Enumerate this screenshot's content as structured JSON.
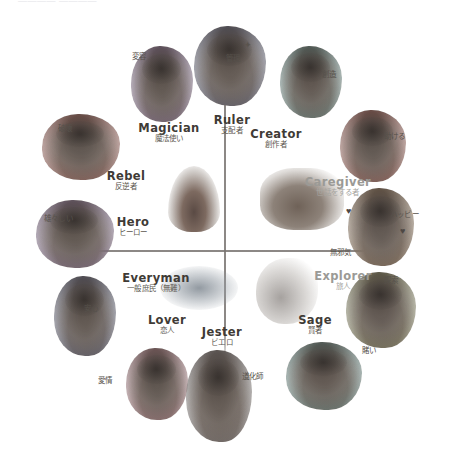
{
  "header": {
    "top_crumb": "————   ————"
  },
  "diagram": {
    "center_elements": [
      {
        "name": "fire",
        "label": "fire-smudge"
      },
      {
        "name": "seed",
        "label": "seed-sprout-smudge"
      },
      {
        "name": "wind",
        "label": "wind-smudge"
      },
      {
        "name": "smoke",
        "label": "smoke-smudge"
      }
    ],
    "archetypes": [
      {
        "en": "Ruler",
        "jp": "支配者",
        "keyword": "管理",
        "faint": false
      },
      {
        "en": "Creator",
        "jp": "創作者",
        "keyword": "創造",
        "faint": false
      },
      {
        "en": "Caregiver",
        "jp": "世話をする者",
        "keyword": "助ける",
        "faint": true
      },
      {
        "en": "Explorer",
        "jp": "旅人",
        "keyword": "探索",
        "faint": true
      },
      {
        "en": "Sage",
        "jp": "賢者",
        "keyword": "賭い",
        "faint": false
      },
      {
        "en": "Jester",
        "jp": "ビエロ",
        "keyword": "道化師",
        "faint": false
      },
      {
        "en": "Lover",
        "jp": "恋人",
        "keyword": "愛情",
        "faint": false
      },
      {
        "en": "Everyman",
        "jp": "一般庶民（無難）",
        "keyword": "安心",
        "faint": false
      },
      {
        "en": "Hero",
        "jp": "ヒーロー",
        "keyword": "雄々しい",
        "faint": false
      },
      {
        "en": "Rebel",
        "jp": "反逆者",
        "keyword": "破壊",
        "faint": false
      },
      {
        "en": "Magician",
        "jp": "魔法使い",
        "keyword": "変容",
        "faint": false
      },
      {
        "en": "Innocent",
        "jp": "無邪気",
        "keyword": "ハッビー",
        "faint": false
      }
    ],
    "extra_keywords": [
      {
        "text": "無邪気"
      }
    ],
    "marks": [
      {
        "glyph": "✦",
        "name": "sparkle-mark"
      },
      {
        "glyph": "♥",
        "name": "heart-mark"
      },
      {
        "glyph": "♥",
        "name": "heart-mark"
      }
    ]
  }
}
